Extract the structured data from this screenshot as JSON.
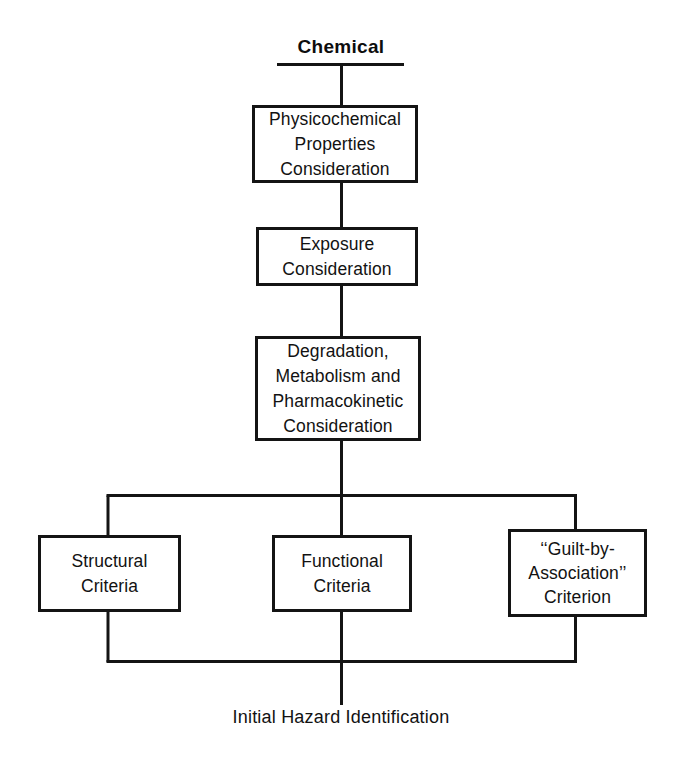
{
  "diagram": {
    "title": "Chemical",
    "outcome_label": "Initial Hazard Identification",
    "line_color": "#141414",
    "background_color": "#ffffff",
    "text_color": "#121212",
    "nodes": {
      "physicochemical": "Physicochemical\nProperties\nConsideration",
      "exposure": "Exposure\nConsideration",
      "degradation": "Degradation,\nMetabolism and\nPharmacokinetic\nConsideration",
      "structural": "Structural\nCriteria",
      "functional": "Functional\nCriteria",
      "guilt": "‘‘Guilt-by-\nAssociation’’\nCriterion"
    }
  }
}
